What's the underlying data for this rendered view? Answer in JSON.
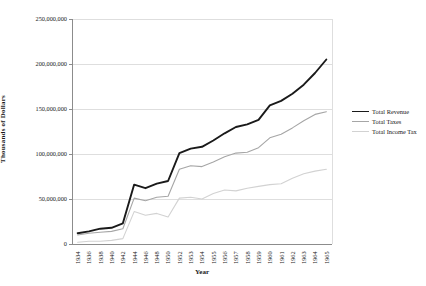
{
  "chart_data": {
    "type": "line",
    "title": "",
    "xlabel": "Year",
    "ylabel": "Thousands of Dollars",
    "grid": "horizontal",
    "legend_position": "right",
    "categories": [
      "1934",
      "1936",
      "1938",
      "1940",
      "1942",
      "1944",
      "1946",
      "1948",
      "1950",
      "1952",
      "1953",
      "1954",
      "1955",
      "1956",
      "1957",
      "1958",
      "1959",
      "1960",
      "1961",
      "1962",
      "1963",
      "1964",
      "1965"
    ],
    "y_axis": {
      "min": 0,
      "max": 250000000,
      "tick_interval": 50000000,
      "tick_labels": [
        "0",
        "50,000,000",
        "100,000,000",
        "150,000,000",
        "200,000,000",
        "250,000,000"
      ]
    },
    "series": [
      {
        "name": "Total Income Tax",
        "color": "#d2d2d2",
        "line_width": 1.1,
        "values": [
          2000000,
          3000000,
          3000000,
          4000000,
          6000000,
          36000000,
          32000000,
          34000000,
          30000000,
          51000000,
          52000000,
          50000000,
          56000000,
          60000000,
          59000000,
          62000000,
          64000000,
          66000000,
          67000000,
          73000000,
          78000000,
          81000000,
          83000000
        ]
      },
      {
        "name": "Total Taxes",
        "color": "#a6a6a6",
        "line_width": 1.1,
        "values": [
          10000000,
          12000000,
          13000000,
          14000000,
          17000000,
          51000000,
          48000000,
          52000000,
          53000000,
          83000000,
          87000000,
          86000000,
          91000000,
          97000000,
          101000000,
          102000000,
          107000000,
          118000000,
          122000000,
          129000000,
          137000000,
          144000000,
          147000000
        ]
      },
      {
        "name": "Total Revenue",
        "color": "#1a1a1a",
        "line_width": 1.9,
        "values": [
          12000000,
          14000000,
          17000000,
          18000000,
          23000000,
          66000000,
          62000000,
          67000000,
          70000000,
          101000000,
          106000000,
          108000000,
          115000000,
          123000000,
          130000000,
          133000000,
          138000000,
          154000000,
          159000000,
          167000000,
          177000000,
          190000000,
          205000000
        ]
      }
    ],
    "legend_order": [
      "Total Revenue",
      "Total Taxes",
      "Total Income Tax"
    ],
    "colors": {
      "gridline": "#d6d6d6",
      "axis": "#808080",
      "plot_border": "#d6d6d6",
      "background": "#ffffff"
    }
  }
}
